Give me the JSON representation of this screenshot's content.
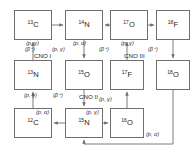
{
  "diagram": {
    "stroke_color": "#6e6e6e",
    "text_color": "#1b1b1b",
    "background": "#ffffff"
  },
  "nodes": [
    {
      "id": "c13",
      "mass": "13",
      "element": "C",
      "x": 14,
      "y": 10,
      "w": 38,
      "h": 30
    },
    {
      "id": "n14",
      "mass": "14",
      "element": "N",
      "x": 65,
      "y": 10,
      "w": 38,
      "h": 30
    },
    {
      "id": "o17",
      "mass": "17",
      "element": "O",
      "x": 110,
      "y": 10,
      "w": 38,
      "h": 30
    },
    {
      "id": "f18",
      "mass": "18",
      "element": "F",
      "x": 156,
      "y": 10,
      "w": 34,
      "h": 30
    },
    {
      "id": "n13",
      "mass": "13",
      "element": "N",
      "x": 14,
      "y": 60,
      "w": 38,
      "h": 30
    },
    {
      "id": "o15",
      "mass": "15",
      "element": "O",
      "x": 65,
      "y": 60,
      "w": 38,
      "h": 30
    },
    {
      "id": "f17",
      "mass": "17",
      "element": "F",
      "x": 110,
      "y": 60,
      "w": 34,
      "h": 30
    },
    {
      "id": "o18",
      "mass": "18",
      "element": "O",
      "x": 156,
      "y": 60,
      "w": 34,
      "h": 30
    },
    {
      "id": "c12",
      "mass": "12",
      "element": "C",
      "x": 14,
      "y": 108,
      "w": 38,
      "h": 30
    },
    {
      "id": "n15",
      "mass": "15",
      "element": "N",
      "x": 65,
      "y": 108,
      "w": 38,
      "h": 30
    },
    {
      "id": "o16",
      "mass": "16",
      "element": "O",
      "x": 110,
      "y": 108,
      "w": 34,
      "h": 30
    }
  ],
  "reaction_labels": [
    {
      "id": "r1",
      "text": "(p, γ)",
      "x": 26,
      "y": 41,
      "reaction": "c13-to-n14"
    },
    {
      "id": "r2",
      "text": "(p, α)",
      "x": 73,
      "y": 41,
      "reaction": "o17-to-n14"
    },
    {
      "id": "r3",
      "text": "(p, γ)",
      "x": 121,
      "y": 41,
      "reaction": "o17-to-f18"
    },
    {
      "id": "r4",
      "text": "(β⁺)",
      "x": 25,
      "y": 47,
      "reaction": "n13-to-c13"
    },
    {
      "id": "r5",
      "text": "(p, γ)",
      "x": 52,
      "y": 47,
      "reaction": "n14-to-o15"
    },
    {
      "id": "r6",
      "text": "(β⁺)",
      "x": 99,
      "y": 47,
      "reaction": "f17-to-o17"
    },
    {
      "id": "r7",
      "text": "(β⁺)",
      "x": 148,
      "y": 47,
      "reaction": "f18-to-o18"
    },
    {
      "id": "r8",
      "text": "(p, γ)",
      "x": 24,
      "y": 93,
      "reaction": "c12-to-n13"
    },
    {
      "id": "r9",
      "text": "(β⁺)",
      "x": 53,
      "y": 93,
      "reaction": "o15-to-n15"
    },
    {
      "id": "r10",
      "text": "(p, γ)",
      "x": 99,
      "y": 97,
      "reaction": "o16-to-f17"
    },
    {
      "id": "r11",
      "text": "(p, α)",
      "x": 36,
      "y": 110,
      "reaction": "n15-to-c12"
    },
    {
      "id": "r12",
      "text": "(p, γ)",
      "x": 86,
      "y": 110,
      "reaction": "n15-to-o16"
    },
    {
      "id": "r13",
      "text": "(p, α)",
      "x": 146,
      "y": 132,
      "reaction": "o18-to-n15"
    }
  ],
  "cycle_labels": [
    {
      "id": "cno1",
      "text": "CNO I",
      "x": 34,
      "y": 53
    },
    {
      "id": "cno2",
      "text": "CNO II",
      "x": 79,
      "y": 94
    },
    {
      "id": "cno3",
      "text": "CNO III",
      "x": 124,
      "y": 53
    }
  ]
}
